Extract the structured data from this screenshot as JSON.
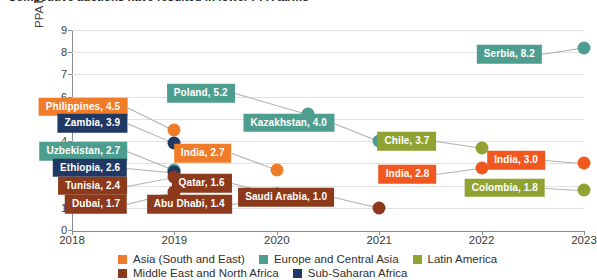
{
  "chart_data": {
    "type": "scatter",
    "title": "Competitive auctions have resulted in lower PPA tariffs",
    "xlabel": "",
    "ylabel": "PPA tariff estimates based on auctions (US$0.01 per kWh)",
    "xlim": [
      2018,
      2023
    ],
    "ylim": [
      0,
      9
    ],
    "yticks": [
      "0",
      "1",
      "2",
      "3",
      "4",
      "5",
      "6",
      "7",
      "8",
      "9"
    ],
    "xticks": [
      "2018",
      "2019",
      "2020",
      "2021",
      "2022",
      "2023"
    ],
    "grid": true,
    "legend_position": "bottom",
    "points": [
      {
        "label": "Philippines, 4.5",
        "country": "Philippines",
        "value": 4.5,
        "x": 2019.0,
        "region": "Asia (South and East)",
        "color": "#F07B28",
        "label_side": "left"
      },
      {
        "label": "Zambia, 3.9",
        "country": "Zambia",
        "value": 3.9,
        "x": 2019.0,
        "region": "Sub-Saharan Africa",
        "color": "#1F3864",
        "label_side": "left"
      },
      {
        "label": "Uzbekistan, 2.7",
        "country": "Uzbekistan",
        "value": 2.7,
        "x": 2019.0,
        "region": "Europe and Central Asia",
        "color": "#4E9E8F",
        "label_side": "left"
      },
      {
        "label": "Ethiopia, 2.6",
        "country": "Ethiopia",
        "value": 2.6,
        "x": 2019.0,
        "region": "Sub-Saharan Africa",
        "color": "#1F3864",
        "label_side": "left"
      },
      {
        "label": "Tunisia, 2.4",
        "country": "Tunisia",
        "value": 2.4,
        "x": 2019.0,
        "region": "Middle East and North Africa",
        "color": "#8C3A1B",
        "label_side": "left"
      },
      {
        "label": "Dubai, 1.7",
        "country": "Dubai",
        "value": 1.7,
        "x": 2019.0,
        "region": "Middle East and North Africa",
        "color": "#8C3A1B",
        "label_side": "left"
      },
      {
        "label": "Poland, 5.2",
        "country": "Poland",
        "value": 5.2,
        "x": 2020.3,
        "region": "Europe and Central Asia",
        "color": "#4E9E8F",
        "label_side": "left"
      },
      {
        "label": "India, 2.7",
        "country": "India",
        "value": 2.7,
        "x": 2020.0,
        "region": "Asia (South and East)",
        "color": "#F07B28",
        "label_side": "left"
      },
      {
        "label": "Qatar, 1.6",
        "country": "Qatar",
        "value": 1.6,
        "x": 2020.0,
        "region": "Middle East and North Africa",
        "color": "#8C3A1B",
        "label_side": "left"
      },
      {
        "label": "Abu Dhabi, 1.4",
        "country": "Abu Dhabi",
        "value": 1.4,
        "x": 2020.0,
        "region": "Middle East and North Africa",
        "color": "#8C3A1B",
        "label_side": "left"
      },
      {
        "label": "Kazakhstan, 4.0",
        "country": "Kazakhstan",
        "value": 4.0,
        "x": 2021.0,
        "region": "Europe and Central Asia",
        "color": "#4E9E8F",
        "label_side": "left"
      },
      {
        "label": "Saudi Arabia, 1.0",
        "country": "Saudi Arabia",
        "value": 1.0,
        "x": 2021.0,
        "region": "Middle East and North Africa",
        "color": "#8C3A1B",
        "label_side": "left"
      },
      {
        "label": "Chile, 3.7",
        "country": "Chile",
        "value": 3.7,
        "x": 2022.0,
        "region": "Latin America",
        "color": "#8FA232",
        "label_side": "left"
      },
      {
        "label": "India, 2.8",
        "country": "India",
        "value": 2.8,
        "x": 2022.0,
        "region": "Asia (South and East)",
        "color": "#F1581F",
        "label_side": "left"
      },
      {
        "label": "Serbia, 8.2",
        "country": "Serbia",
        "value": 8.2,
        "x": 2023.0,
        "region": "Europe and Central Asia",
        "color": "#4E9E8F",
        "label_side": "left"
      },
      {
        "label": "India, 3.0",
        "country": "India",
        "value": 3.0,
        "x": 2023.0,
        "region": "Asia (South and East)",
        "color": "#F1581F",
        "label_side": "left"
      },
      {
        "label": "Colombia, 1.8",
        "country": "Colombia",
        "value": 1.8,
        "x": 2023.0,
        "region": "Latin America",
        "color": "#8FA232",
        "label_side": "left"
      }
    ],
    "legend": [
      {
        "label": "Asia (South and East)",
        "color": "#F07B28"
      },
      {
        "label": "Europe and Central Asia",
        "color": "#4E9E8F"
      },
      {
        "label": "Latin America",
        "color": "#8FA232"
      },
      {
        "label": "Middle East and North Africa",
        "color": "#8C3A1B"
      },
      {
        "label": "Sub-Saharan Africa",
        "color": "#1F3864"
      }
    ]
  }
}
